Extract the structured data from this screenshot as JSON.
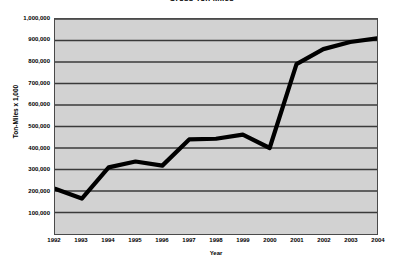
{
  "chart_data": {
    "type": "line",
    "title": "Gross Ton Miles",
    "xlabel": "Year",
    "ylabel": "Ton-Miles x 1,000",
    "categories": [
      "1992",
      "1993",
      "1994",
      "1995",
      "1996",
      "1997",
      "1998",
      "1999",
      "2000",
      "2001",
      "2002",
      "2003",
      "2004"
    ],
    "x": [
      1992,
      1993,
      1994,
      1995,
      1996,
      1997,
      1998,
      1999,
      2000,
      2001,
      2002,
      2003,
      2004
    ],
    "values": [
      210000,
      165000,
      310000,
      337000,
      318000,
      440000,
      443000,
      462000,
      400000,
      790000,
      860000,
      893000,
      910000
    ],
    "series": [
      {
        "name": "Gross Ton Miles",
        "values": [
          210000,
          165000,
          310000,
          337000,
          318000,
          440000,
          443000,
          462000,
          400000,
          790000,
          860000,
          893000,
          910000
        ]
      }
    ],
    "ylim": [
      0,
      1000000
    ],
    "xlim": [
      1992,
      2004
    ],
    "ytick_values": [
      100000,
      200000,
      300000,
      400000,
      500000,
      600000,
      700000,
      800000,
      900000,
      1000000
    ],
    "ytick_labels": [
      "100,000",
      "200,000",
      "300,000",
      "400,000",
      "500,000",
      "600,000",
      "700,000",
      "800,000",
      "900,000",
      "1,000,000"
    ],
    "grid": true,
    "grid_axis": "y",
    "legend": false,
    "legend_position": "none",
    "plot_background_color": "#d2d2d2",
    "line_color": "#000000",
    "gridline_color": "#3a3a3a",
    "border_color": "#4a4a4a"
  }
}
